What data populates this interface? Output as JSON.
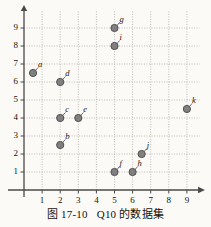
{
  "caption": {
    "figure_number": "图 17-10",
    "title": "Q10 的数据集",
    "full": "图 17-10　Q10 的数据集"
  },
  "colors": {
    "background": "#fbfaf7",
    "axis": "#4a4a4a",
    "grid": "#b9b5ad",
    "marker_fill": "#808080",
    "marker_stroke": "#4f4f4f",
    "text": "#15120e"
  },
  "chart_data": {
    "type": "scatter",
    "xlabel": "",
    "ylabel": "",
    "xlim": [
      0,
      9.7
    ],
    "ylim": [
      0,
      9.7
    ],
    "xticks": [
      "1",
      "2",
      "3",
      "4",
      "5",
      "6",
      "7",
      "8",
      "9"
    ],
    "yticks": [
      "1",
      "2",
      "3",
      "4",
      "5",
      "6",
      "7",
      "8",
      "9"
    ],
    "grid": true,
    "legend": null,
    "points": [
      {
        "label": "a",
        "x": 0.5,
        "y": 6.5
      },
      {
        "label": "b",
        "x": 2,
        "y": 2.5
      },
      {
        "label": "c",
        "x": 2,
        "y": 4
      },
      {
        "label": "d",
        "x": 2,
        "y": 6
      },
      {
        "label": "e",
        "x": 3,
        "y": 4
      },
      {
        "label": "f",
        "x": 5,
        "y": 1
      },
      {
        "label": "g",
        "x": 5,
        "y": 9
      },
      {
        "label": "h",
        "x": 6,
        "y": 1
      },
      {
        "label": "i",
        "x": 5,
        "y": 8
      },
      {
        "label": "j",
        "x": 6.5,
        "y": 2
      },
      {
        "label": "k",
        "x": 9,
        "y": 4.5
      }
    ]
  }
}
